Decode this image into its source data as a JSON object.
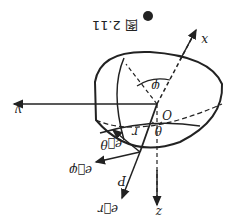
{
  "figure": {
    "caption_marker": "●",
    "caption": "图 2.11",
    "orientation": "rotated 180°",
    "labels": {
      "x_axis": "x",
      "y_axis": "y",
      "z_axis": "z",
      "origin": "O",
      "phi": "φ",
      "theta": "θ",
      "radius": "r",
      "point": "P",
      "e_r": "e⃗r",
      "e_theta": "e⃗θ",
      "e_phi": "e⃗φ"
    },
    "colors": {
      "ink": "#222222",
      "background": "#ffffff"
    }
  }
}
